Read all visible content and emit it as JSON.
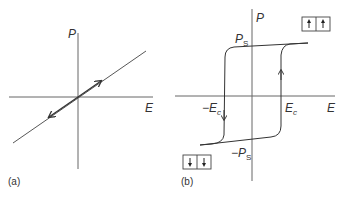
{
  "panel_a": {
    "caption": "(a)",
    "x_axis_label": "E",
    "y_axis_label": "P",
    "description": "Linear dielectric: P proportional to E"
  },
  "panel_b": {
    "caption": "(b)",
    "x_axis_label": "E",
    "y_axis_label": "P",
    "ps_label": "P",
    "ps_sub": "S",
    "neg_ps_label": "−P",
    "neg_ps_sub": "S",
    "ec_label": "E",
    "ec_sub": "c",
    "neg_ec_label": "−E",
    "neg_ec_sub": "c",
    "domain_up_icon": "arrow-up-up",
    "domain_down_icon": "arrow-down-down",
    "description": "Ferroelectric hysteresis loop"
  },
  "colors": {
    "line": "#333333",
    "axis": "#555555"
  }
}
